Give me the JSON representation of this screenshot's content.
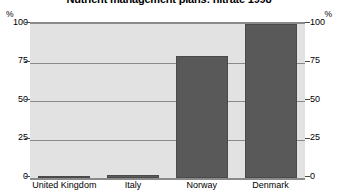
{
  "chart_data": {
    "type": "bar",
    "title": "Nutrient management plans: nitrate 1998",
    "xlabel": "",
    "ylabel": "%",
    "ylabel_right": "%",
    "ylim": [
      0,
      100
    ],
    "yticks": [
      0,
      25,
      50,
      75,
      100
    ],
    "ytick_labels": [
      "0",
      "25",
      "50",
      "75",
      "100"
    ],
    "grid": true,
    "legend": false,
    "categories": [
      "United Kingdom",
      "Italy",
      "Norway",
      "Denmark"
    ],
    "values": [
      0,
      2,
      79,
      100
    ],
    "colors": {
      "bar": "#595959",
      "bar_edge": "#4a4a4a",
      "plot_background": "#e2e2e2",
      "gridline": "#8a8a8a",
      "figure_background": "#ffffff",
      "text": "#000000"
    }
  }
}
